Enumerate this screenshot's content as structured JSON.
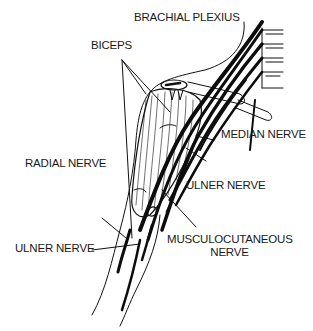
{
  "figure": {
    "ink_color": "#111111",
    "background": "#ffffff"
  },
  "labels": {
    "brachial_plexus": "BRACHIAL PLEXIUS",
    "biceps": "BICEPS",
    "median_nerve": "MEDIAN NERVE",
    "radial_nerve": "RADIAL NERVE",
    "ulner_nerve_upper": "ULNER NERVE",
    "ulner_nerve_lower": "ULNER NERVE",
    "musculocutaneous_line1": "MUSCULOCUTANEOUS",
    "musculocutaneous_line2": "NERVE"
  }
}
